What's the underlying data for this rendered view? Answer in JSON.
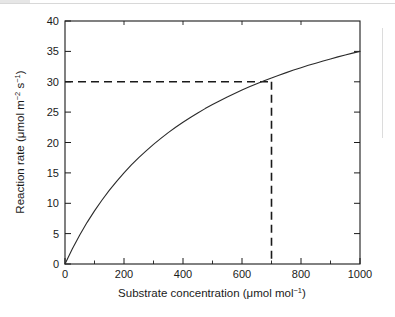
{
  "figure": {
    "background_color": "#ffffff",
    "frame_color": "#1a1a1a",
    "curve_color": "#2b2b2b",
    "guide_color": "#1a1a1a"
  },
  "chart_data": {
    "type": "line",
    "title": "",
    "xlabel_parts": {
      "main": "Substrate concentration (",
      "mu": "μmol mol",
      "sup": "−1",
      "close": ")"
    },
    "ylabel_parts": {
      "main": "Reaction rate (",
      "mu": "μmol m",
      "sup1": "−2",
      "mid": " s",
      "sup2": "−1",
      "close": ")"
    },
    "xlabel": "Substrate concentration (μmol mol−1)",
    "ylabel": "Reaction rate (μmol m−2 s−1)",
    "xlim": [
      0,
      1000
    ],
    "ylim": [
      0,
      40
    ],
    "xticks": [
      0,
      200,
      400,
      600,
      800,
      1000
    ],
    "xtick_labels": [
      "0",
      "200",
      "400",
      "600",
      "800",
      "1000"
    ],
    "xminor_step": 100,
    "yticks": [
      0,
      5,
      10,
      15,
      20,
      25,
      30,
      35,
      40
    ],
    "ytick_labels": [
      "0",
      "5",
      "10",
      "15",
      "20",
      "25",
      "30",
      "35",
      "40"
    ],
    "grid": false,
    "legend": null,
    "model": {
      "name": "michaelis-menten",
      "vmax": 52.5,
      "km": 500
    },
    "x": [
      0,
      25,
      50,
      75,
      100,
      125,
      150,
      175,
      200,
      225,
      250,
      275,
      300,
      325,
      350,
      375,
      400,
      425,
      450,
      475,
      500,
      525,
      550,
      575,
      600,
      625,
      650,
      675,
      700,
      725,
      750,
      775,
      800,
      825,
      850,
      875,
      900,
      925,
      950,
      975,
      1000
    ],
    "values": [
      0,
      2.5,
      4.77,
      6.86,
      8.75,
      10.5,
      12.12,
      13.6,
      15,
      16.3,
      17.5,
      18.63,
      19.69,
      20.67,
      21.62,
      22.5,
      23.33,
      24.12,
      24.87,
      25.58,
      26.25,
      26.89,
      27.5,
      28.08,
      28.64,
      29.17,
      29.67,
      30.16,
      30.63,
      31.07,
      31.5,
      31.92,
      32.31,
      32.7,
      33.06,
      33.42,
      33.75,
      34.09,
      34.4,
      34.71,
      35
    ],
    "annotations": [
      {
        "type": "guide-lines",
        "style": "dashed",
        "x": 700,
        "y": 30,
        "description": "dashed horizontal line from y-axis at 30 to the curve, and dashed vertical line from the curve down to x-axis at 700"
      }
    ]
  }
}
